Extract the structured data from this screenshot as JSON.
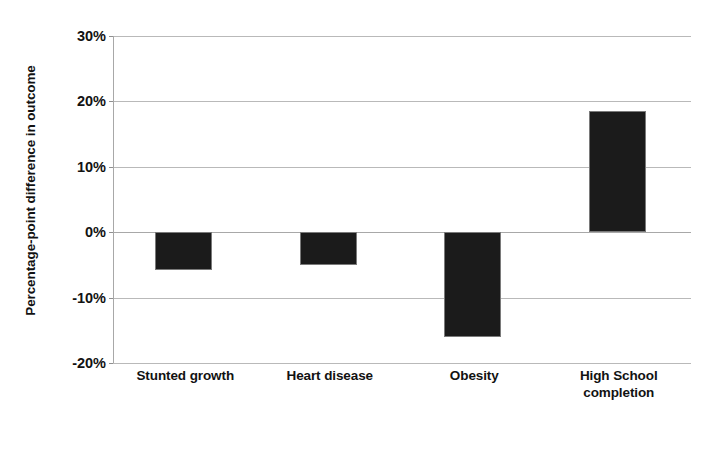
{
  "chart_data": {
    "type": "bar",
    "title": "",
    "subtitle": "",
    "xlabel": "",
    "ylabel": "Percentage-point difference in outcome",
    "categories": [
      "Stunted growth",
      "Heart disease",
      "Obesity",
      "High School completion"
    ],
    "category_lines": [
      [
        "Stunted growth"
      ],
      [
        "Heart disease"
      ],
      [
        "Obesity"
      ],
      [
        "High School",
        "completion"
      ]
    ],
    "values": [
      -5.8,
      -5.0,
      -16.0,
      18.5
    ],
    "value_labels": [
      "-5.8%",
      "-5.0%",
      "-16.0%",
      "18.5%"
    ],
    "ylim": [
      -20,
      30
    ],
    "ytick_values": [
      30,
      20,
      10,
      0,
      -10,
      -20
    ],
    "ytick_labels": [
      "30%",
      "20%",
      "10%",
      "0%",
      "-10%",
      "-20%"
    ],
    "grid": true,
    "grid_axis": "y",
    "legend": false,
    "legend_position": "none",
    "bar_color": "#1b1b1b",
    "bar_edge_color": "#7a7a7a",
    "grid_color": "#b9b9b9",
    "axis_color": "#a8a8a8",
    "background_color": "#ffffff",
    "text_color": "#121212"
  }
}
